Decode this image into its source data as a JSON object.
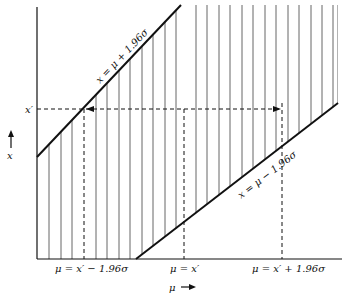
{
  "diagram": {
    "y_axis": {
      "label": "x",
      "arrow": "up"
    },
    "x_axis": {
      "label": "μ",
      "arrow": "right"
    },
    "upper_line": {
      "label": "x = μ + 1.96σ"
    },
    "lower_line": {
      "label": "x = μ − 1.96σ"
    },
    "observed_value": {
      "label": "x′"
    },
    "x_ticks": [
      {
        "label": "μ = x′ − 1.96σ"
      },
      {
        "label": "μ = x′"
      },
      {
        "label": "μ = x′ + 1.96σ"
      }
    ],
    "colors": {
      "ink": "#111111",
      "hatch": "#555555",
      "background": "#ffffff"
    }
  }
}
